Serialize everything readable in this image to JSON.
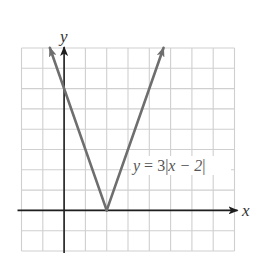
{
  "chart_data": {
    "type": "line",
    "title": "",
    "xlabel": "x",
    "ylabel": "y",
    "xlim": [
      -2,
      8
    ],
    "ylim": [
      -2,
      8
    ],
    "grid": true,
    "grid_step": 1,
    "tick_labels_shown": false,
    "series": [
      {
        "name": "y = 3|x − 2|",
        "function": "y = 3|x - 2|",
        "x": [
          -0.67,
          0,
          1,
          2,
          3,
          4,
          4.67
        ],
        "y": [
          8,
          6,
          3,
          0,
          3,
          6,
          8
        ],
        "vertex": [
          2,
          0
        ],
        "y_intercept": 6,
        "arrows_at_ends": true
      }
    ],
    "annotations": [
      {
        "text": "y = 3|x − 2|",
        "x": 3.3,
        "y": 2.0
      }
    ]
  },
  "labels": {
    "x_axis": "x",
    "y_axis": "y",
    "equation_y": "y",
    "equation_eq": " = 3",
    "equation_bar_open": "|",
    "equation_inner": "x − 2",
    "equation_bar_close": "|"
  },
  "colors": {
    "background": "#ffffff",
    "grid": "#cfcfcf",
    "axis": "#1e1e1e",
    "curve": "#6e6e6e",
    "text": "#333333"
  }
}
